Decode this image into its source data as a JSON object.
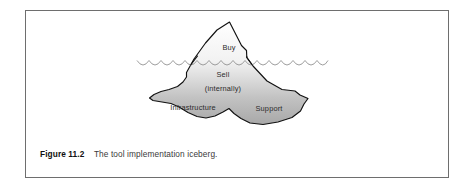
{
  "figure": {
    "caption_label": "Figure 11.2",
    "caption_text": "The tool implementation iceberg.",
    "frame_color": "#6e6e6e",
    "background_color": "#ffffff"
  },
  "diagram": {
    "type": "iceberg-diagram",
    "title": "The tool implementation iceberg",
    "outline_color": "#000000",
    "above_water_fill": "#fbfbfb",
    "below_water_fill": "#b4b4b4",
    "water_line_color": "#8d8d8d",
    "labels": [
      {
        "id": "buy",
        "text": "Buy",
        "position": "above-water",
        "x": 228,
        "y": 47
      },
      {
        "id": "sell",
        "text": "Sell",
        "position": "below-water",
        "x": 222,
        "y": 74
      },
      {
        "id": "internally",
        "text": "(internally)",
        "position": "below-water",
        "x": 222,
        "y": 88
      },
      {
        "id": "infrastructure",
        "text": "Infrastructure",
        "position": "below-water",
        "x": 192,
        "y": 107
      },
      {
        "id": "support",
        "text": "Support",
        "position": "below-water",
        "x": 268,
        "y": 108
      }
    ],
    "water_line": {
      "y": 60,
      "x_start": 136,
      "x_end": 327,
      "scallop_count": 16
    }
  }
}
